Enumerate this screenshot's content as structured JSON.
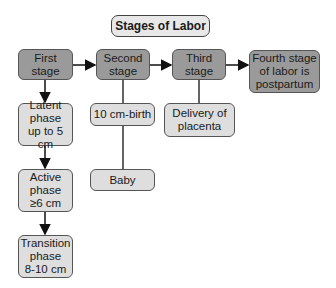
{
  "diagram": {
    "title": "Stages of Labor",
    "stages": [
      {
        "id": "first",
        "label": "First\nstage"
      },
      {
        "id": "second",
        "label": "Second\nstage"
      },
      {
        "id": "third",
        "label": "Third\nstage"
      },
      {
        "id": "fourth",
        "label": "Fourth stage\nof labor is\npostpartum"
      }
    ],
    "first_stage_phases": [
      {
        "label": "Latent\nphase\nup to 5 cm"
      },
      {
        "label": "Active\nphase\n≥6 cm"
      },
      {
        "label": "Transition\nphase\n8-10 cm"
      }
    ],
    "second_stage_details": [
      {
        "label": "10 cm-birth"
      },
      {
        "label": "Baby"
      }
    ],
    "third_stage_details": [
      {
        "label": "Delivery of\nplacenta"
      }
    ]
  }
}
